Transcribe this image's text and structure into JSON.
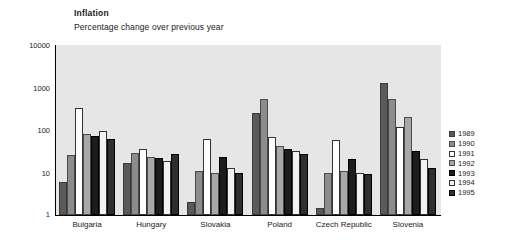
{
  "chart_data": {
    "type": "bar",
    "title": "Inflation",
    "subtitle": "Percentage change over previous year",
    "xlabel": "",
    "ylabel": "",
    "yscale": "log",
    "ylim": [
      1,
      10000
    ],
    "yticks": [
      "10000",
      "1000",
      "100",
      "10",
      "1"
    ],
    "grid": false,
    "legend_position": "right",
    "categories": [
      "Bulgaria",
      "Hungary",
      "Slovakia",
      "Poland",
      "Czech Republic",
      "Slovenia"
    ],
    "series": [
      {
        "name": "1989",
        "color": "#5a5a5a",
        "values": [
          6,
          17,
          2,
          250,
          1.5,
          1300
        ]
      },
      {
        "name": "1990",
        "color": "#8c8c8c",
        "values": [
          26,
          29,
          11,
          550,
          10,
          550
        ]
      },
      {
        "name": "1991",
        "color": "#ffffff",
        "values": [
          330,
          35,
          61,
          70,
          57,
          115
        ]
      },
      {
        "name": "1992",
        "color": "#a8a8a8",
        "values": [
          82,
          23,
          10,
          43,
          11,
          200
        ]
      },
      {
        "name": "1993",
        "color": "#1c1c1c",
        "values": [
          73,
          22,
          23,
          35,
          21,
          32
        ]
      },
      {
        "name": "1994",
        "color": "#f2f2f2",
        "values": [
          96,
          19,
          13,
          32,
          10,
          21
        ]
      },
      {
        "name": "1995",
        "color": "#2e2e2e",
        "values": [
          62,
          28,
          10,
          28,
          9,
          13
        ]
      }
    ]
  },
  "legend": {
    "items": [
      {
        "label": "1989"
      },
      {
        "label": "1990"
      },
      {
        "label": "1991"
      },
      {
        "label": "1992"
      },
      {
        "label": "1993"
      },
      {
        "label": "1994"
      },
      {
        "label": "1995"
      }
    ]
  }
}
